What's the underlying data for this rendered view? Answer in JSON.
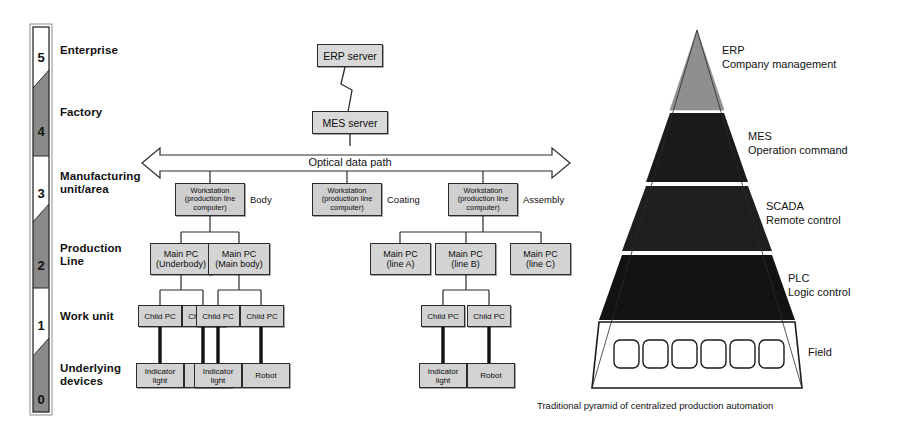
{
  "levels": [
    {
      "number": "5",
      "label": "Enterprise",
      "shade": "light"
    },
    {
      "number": "4",
      "label": "Factory",
      "shade": "dark"
    },
    {
      "number": "3",
      "label": "Manufacturing\nunit/area",
      "shade": "light"
    },
    {
      "number": "2",
      "label": "Production\nLine",
      "shade": "dark"
    },
    {
      "number": "1",
      "label": "Work unit",
      "shade": "light"
    },
    {
      "number": "0",
      "label": "Underlying\ndevices",
      "shade": "dark"
    }
  ],
  "servers": {
    "erp": "ERP server",
    "mes": "MES server"
  },
  "bus": {
    "label": "Optical data path"
  },
  "workstations": [
    {
      "text": "Workstation\n(production line\ncomputer)",
      "group": "Body"
    },
    {
      "text": "Workstation\n(production line\ncomputer)",
      "group": "Coating"
    },
    {
      "text": "Workstation\n(production line\ncomputer)",
      "group": "Assembly"
    }
  ],
  "main_pcs": [
    {
      "text": "Main PC\n(Underbody)"
    },
    {
      "text": "Main PC\n(Main body)"
    },
    {
      "text": "Main PC\n(line A)"
    },
    {
      "text": "Main PC\n(line  B)"
    },
    {
      "text": "Main PC\n(line C)"
    }
  ],
  "child_pcs": [
    {
      "text": "Child PC"
    },
    {
      "text": "Child PC"
    },
    {
      "text": "Child PC"
    },
    {
      "text": "Child PC"
    },
    {
      "text": "Child PC"
    },
    {
      "text": "Child PC"
    }
  ],
  "devices": [
    {
      "text": "Indicator\nlight"
    },
    {
      "text": "Robot"
    },
    {
      "text": "Indicator\nlight"
    },
    {
      "text": "Robot"
    },
    {
      "text": "Indicator\nlight"
    },
    {
      "text": "Robot"
    }
  ],
  "pyramid": {
    "caption": "Traditional pyramid of centralized production automation",
    "tiers": [
      {
        "name": "ERP",
        "subtitle": "Company management",
        "label": "ERP\nCompany management",
        "fill": "#8f8f8f"
      },
      {
        "name": "MES",
        "subtitle": "Operation command",
        "label": "MES\nOperation command",
        "fill": "#1a1a1a"
      },
      {
        "name": "SCADA",
        "subtitle": "Remote control",
        "label": "SCADA\nRemote control",
        "fill": "#1f1f1f"
      },
      {
        "name": "PLC",
        "subtitle": "Logic control",
        "label": "PLC\nLogic control",
        "fill": "#121212"
      },
      {
        "name": "Field",
        "subtitle": "",
        "label": "Field",
        "fill": "#ffffff"
      }
    ],
    "field_cells": 6
  },
  "colors": {
    "bar_dark": "#8a8a8a",
    "bar_light": "#ffffff",
    "box_fill": "#d4d4d4",
    "stroke": "#2b2b2b",
    "pyramid_gray": "#8f8f8f",
    "pyramid_black": "#1a1a1a"
  }
}
